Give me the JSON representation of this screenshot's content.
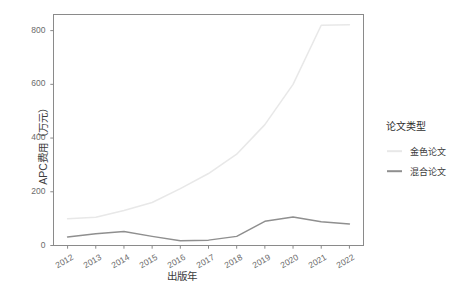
{
  "chart_data": {
    "type": "line",
    "title": "",
    "xlabel": "出版年",
    "ylabel": "APC费用（万元）",
    "x": [
      2012,
      2013,
      2014,
      2015,
      2016,
      2017,
      2018,
      2019,
      2020,
      2021,
      2022
    ],
    "categories": [
      "2012",
      "2013",
      "2014",
      "2015",
      "2016",
      "2017",
      "2018",
      "2019",
      "2020",
      "2021",
      "2022"
    ],
    "series": [
      {
        "name": "金色论文",
        "color": "#e8e8e8",
        "values": [
          100,
          105,
          130,
          160,
          212,
          268,
          340,
          450,
          600,
          820,
          822
        ]
      },
      {
        "name": "混合论文",
        "color": "#8f8f8f",
        "values": [
          32,
          44,
          52,
          34,
          18,
          20,
          34,
          90,
          106,
          88,
          80
        ]
      }
    ],
    "xlim": [
      2011.5,
      2022.5
    ],
    "ylim": [
      0,
      860
    ],
    "xticks": [
      "2012",
      "2013",
      "2014",
      "2015",
      "2016",
      "2017",
      "2018",
      "2019",
      "2020",
      "2021",
      "2022"
    ],
    "yticks": [
      "0",
      "200",
      "400",
      "600",
      "800"
    ],
    "ytick_values": [
      0,
      200,
      400,
      600,
      800
    ],
    "grid": false,
    "legend_position": "right",
    "panel_border_color": "#878787",
    "panel_background": "#ffffff"
  },
  "legend": {
    "title": "论文类型",
    "items": [
      {
        "label": "金色论文",
        "color": "#e8e8e8"
      },
      {
        "label": "混合论文",
        "color": "#8f8f8f"
      }
    ]
  },
  "axes": {
    "x_title": "出版年",
    "y_title": "APC费用（万元）"
  }
}
